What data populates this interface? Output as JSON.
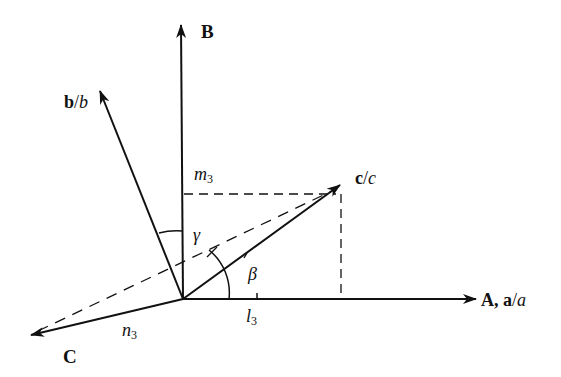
{
  "diagram": {
    "type": "vector-coordinate-diagram",
    "colors": {
      "line": "#111111",
      "background": "#ffffff"
    },
    "origin": {
      "x": 183,
      "y": 299
    },
    "axes": [
      {
        "id": "A",
        "label_bold": "A, a",
        "label_sep": "/",
        "label_ital": "a",
        "tip": {
          "x": 476,
          "y": 299
        }
      },
      {
        "id": "B",
        "label_bold": "B",
        "tip": {
          "x": 181,
          "y": 25
        }
      },
      {
        "id": "C",
        "label_bold": "C",
        "tip": {
          "x": 31,
          "y": 335
        }
      }
    ],
    "vectors": [
      {
        "id": "b",
        "label_bold": "b",
        "label_sep": "/",
        "label_ital": "b",
        "tip": {
          "x": 100,
          "y": 91
        }
      },
      {
        "id": "c",
        "label_bold": "c",
        "label_sep": "/",
        "label_ital": "c",
        "tip": {
          "x": 340,
          "y": 185
        }
      }
    ],
    "projections": {
      "m": {
        "base": "m",
        "sub": "3"
      },
      "l": {
        "base": "l",
        "sub": "3"
      },
      "n": {
        "base": "n",
        "sub": "3"
      }
    },
    "angles": {
      "gamma": "γ",
      "beta": "β"
    }
  }
}
